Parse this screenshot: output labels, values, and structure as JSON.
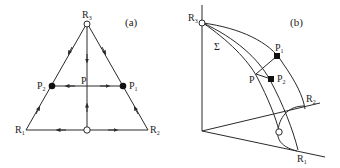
{
  "figure": {
    "panel_a": {
      "label": "(a)",
      "vertices": {
        "R1": {
          "main": "R",
          "sub": "1"
        },
        "R2": {
          "main": "R",
          "sub": "2"
        },
        "R3": {
          "main": "R",
          "sub": "3"
        }
      },
      "points": {
        "P": {
          "main": "P",
          "sub": ""
        },
        "P1": {
          "main": "P",
          "sub": "1"
        },
        "P2": {
          "main": "P",
          "sub": "2"
        }
      }
    },
    "panel_b": {
      "label": "(b)",
      "sigma": "Σ",
      "vertices": {
        "R1": {
          "main": "R",
          "sub": "1"
        },
        "R2": {
          "main": "R",
          "sub": "2"
        },
        "R3": {
          "main": "R",
          "sub": "3"
        }
      },
      "points": {
        "P": {
          "main": "P",
          "sub": ""
        },
        "P1": {
          "main": "P",
          "sub": "1"
        },
        "P2": {
          "main": "P",
          "sub": "2"
        }
      }
    },
    "colors": {
      "line": "#2a2a2a",
      "fixed_point_fill": "#111111",
      "background": "#ffffff"
    }
  }
}
